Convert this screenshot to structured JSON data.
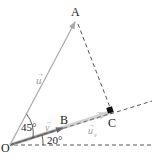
{
  "diagram": {
    "type": "vector-projection",
    "points": {
      "O": {
        "label": "O",
        "x": 10,
        "y": 145
      },
      "A": {
        "label": "A",
        "x": 77,
        "y": 18
      },
      "B": {
        "label": "B",
        "x": 62,
        "y": 124
      },
      "C": {
        "label": "C",
        "x": 112,
        "y": 111
      }
    },
    "vectors": {
      "u": {
        "label": "u",
        "arrow": "→",
        "from": "O",
        "to": "A",
        "color": "#a8a8a8"
      },
      "v": {
        "label": "v",
        "arrow": "→",
        "from": "O",
        "to": "B",
        "color": "#7a7a7a"
      },
      "u_v": {
        "label": "u",
        "subscript": "v",
        "arrow": "→",
        "from": "O",
        "to": "C",
        "color": "#c8c8c8"
      }
    },
    "angles": {
      "between_u_v": {
        "label": "45°"
      },
      "v_to_horizontal": {
        "label": "20°"
      }
    },
    "colors": {
      "dashed": "#444444",
      "right_angle_marker": "#111111",
      "text": "#222222"
    }
  }
}
